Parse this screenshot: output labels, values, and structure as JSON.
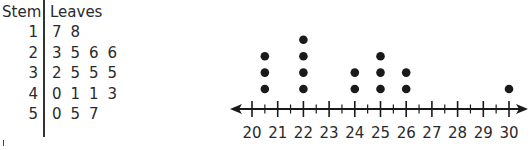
{
  "stem_leaf": {
    "headers": {
      "stem": "Stem",
      "leaves": "Leaves"
    },
    "rows": [
      {
        "stem": "1",
        "leaves": [
          "7",
          "8"
        ]
      },
      {
        "stem": "2",
        "leaves": [
          "3",
          "5",
          "6",
          "6"
        ]
      },
      {
        "stem": "3",
        "leaves": [
          "2",
          "5",
          "5",
          "5"
        ]
      },
      {
        "stem": "4",
        "leaves": [
          "0",
          "1",
          "1",
          "3"
        ]
      },
      {
        "stem": "5",
        "leaves": [
          "0",
          "5",
          "7"
        ]
      }
    ]
  },
  "chart_data": [
    {
      "type": "table",
      "title": "Stem-and-leaf plot",
      "columns": [
        "Stem",
        "Leaves"
      ],
      "rows": [
        [
          "1",
          "7 8"
        ],
        [
          "2",
          "3 5 6 6"
        ],
        [
          "3",
          "2 5 5 5"
        ],
        [
          "4",
          "0 1 1 3"
        ],
        [
          "5",
          "0 5 7"
        ]
      ],
      "values": [
        17,
        18,
        23,
        25,
        26,
        26,
        32,
        35,
        35,
        35,
        40,
        41,
        41,
        43,
        50,
        55,
        57
      ]
    },
    {
      "type": "scatter",
      "title": "Dot plot",
      "xlabel": "",
      "ylabel": "",
      "xlim": [
        20,
        30
      ],
      "tick_labels": [
        "20",
        "21",
        "22",
        "23",
        "24",
        "25",
        "26",
        "27",
        "28",
        "29",
        "30"
      ],
      "minor_ticks": 0.5,
      "grid": false,
      "points": [
        {
          "x": 20.5,
          "count": 3
        },
        {
          "x": 22,
          "count": 4
        },
        {
          "x": 24,
          "count": 2
        },
        {
          "x": 25,
          "count": 3
        },
        {
          "x": 26,
          "count": 2
        },
        {
          "x": 30,
          "count": 1
        }
      ]
    }
  ],
  "colors": {
    "ink": "#1a1a1a",
    "text": "#2a2a2a"
  }
}
